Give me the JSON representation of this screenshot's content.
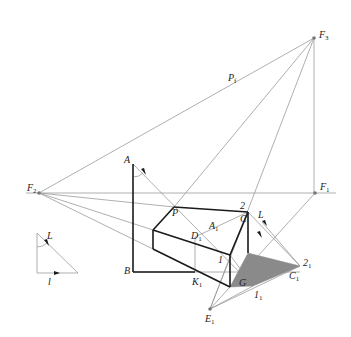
{
  "diagram": {
    "title": "",
    "type": "perspective shadow construction",
    "colors": {
      "thin_line": "#9a9a9a",
      "thick_line": "#1a1a1a",
      "shadow_fill": "#8a8a8a",
      "point": "#777777"
    },
    "labels": {
      "F3": {
        "main": "F",
        "sub": "3"
      },
      "F2": {
        "main": "F",
        "sub": "2"
      },
      "F1": {
        "main": "F",
        "sub": "1"
      },
      "Pf": {
        "main": "P",
        "sub": "f"
      },
      "A": {
        "main": "A",
        "sub": ""
      },
      "B": {
        "main": "B",
        "sub": ""
      },
      "P": {
        "main": "P",
        "sub": ""
      },
      "C": {
        "main": "C",
        "sub": ""
      },
      "two": {
        "main": "2",
        "sub": ""
      },
      "L_main": {
        "main": "L",
        "sub": ""
      },
      "A1": {
        "main": "A",
        "sub": "1"
      },
      "D1": {
        "main": "D",
        "sub": "1"
      },
      "one": {
        "main": "1",
        "sub": ""
      },
      "K1": {
        "main": "K",
        "sub": "1"
      },
      "G": {
        "main": "G",
        "sub": ""
      },
      "two1": {
        "main": "2",
        "sub": "1"
      },
      "C1": {
        "main": "C",
        "sub": "1"
      },
      "one1": {
        "main": "1",
        "sub": "1"
      },
      "E1": {
        "main": "E",
        "sub": "1"
      },
      "L_small": {
        "main": "L",
        "sub": ""
      },
      "l_small": {
        "main": "l",
        "sub": ""
      }
    }
  }
}
